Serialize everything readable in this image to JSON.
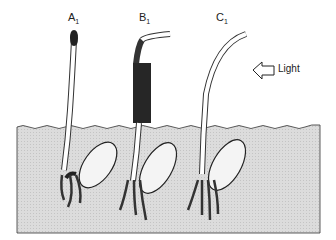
{
  "diagram": {
    "type": "phototropism-experiment",
    "seedlings": [
      {
        "id": "A",
        "label": "A",
        "subscript": "1",
        "treatment": "tip covered",
        "response": "grows straight up"
      },
      {
        "id": "B",
        "label": "B",
        "subscript": "1",
        "treatment": "base covered, tip exposed",
        "response": "tip bends toward light"
      },
      {
        "id": "C",
        "label": "C",
        "subscript": "1",
        "treatment": "uncovered",
        "response": "bends toward light"
      }
    ],
    "light": {
      "label": "Light",
      "direction": "from right"
    },
    "colors": {
      "soil": "#d9d9d9",
      "cover": "#2a2a2a",
      "line": "#333333"
    }
  }
}
